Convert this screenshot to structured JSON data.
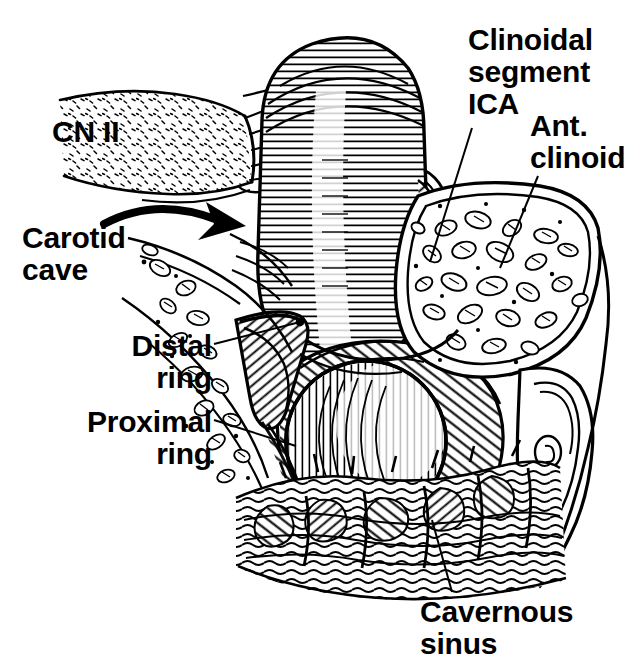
{
  "figure": {
    "style": "pen-and-ink anatomical line drawing",
    "background_color": "#ffffff",
    "ink_color": "#000000"
  },
  "labels": {
    "cn2": "CN II",
    "carotid_cave": "Carotid\ncave",
    "distal_ring": "Distal\nring",
    "proximal_ring": "Proximal\nring",
    "clinoidal_segment": "Clinoidal\nsegment\nICA",
    "ant_clinoid": "Ant.\nclinoid",
    "cavernous_sinus": "Cavernous\nsinus"
  },
  "structures": {
    "optic_nerve": "optic-nerve-cylinder",
    "ica_clinoidal": "clinoidal-ica-tube",
    "ica_cross_section": "ica-cut-cross-section",
    "anterior_clinoid": "anterior-clinoid-cancellous-bone",
    "optic_strut": "optic-strut-bone",
    "cavernous_sinus_plexus": "cavernous-sinus-venous-plexus",
    "distal_dural_ring": "distal-dural-ring-wedge",
    "proximal_dural_ring": "proximal-dural-ring",
    "carotid_cave_arrow": "curved-arrow-right"
  }
}
